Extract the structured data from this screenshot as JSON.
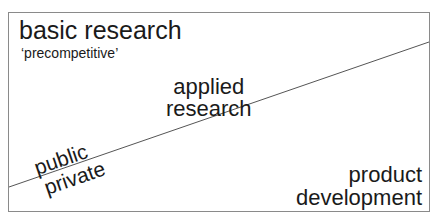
{
  "diagram": {
    "regions": {
      "top_left": {
        "title": "basic research",
        "subtitle": "‘precompetitive’"
      },
      "middle": {
        "line1": "applied",
        "line2": "research"
      },
      "divider_labels": {
        "above": "public",
        "below": "private"
      },
      "bottom_right": {
        "line1": "product",
        "line2": "development"
      }
    },
    "colors": {
      "frame": "#8a8a8a",
      "divider_line": "#555555",
      "text": "#1a1a1a"
    }
  }
}
